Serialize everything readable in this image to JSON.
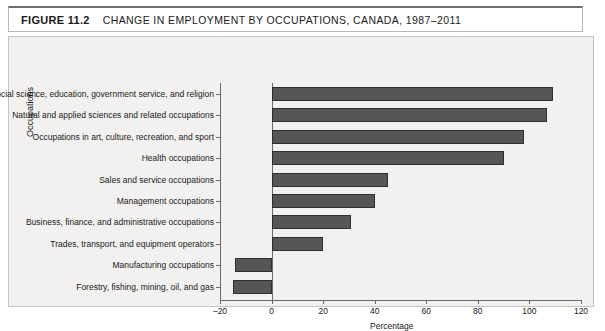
{
  "figure": {
    "label": "FIGURE 11.2",
    "title": "CHANGE IN EMPLOYMENT BY OCCUPATIONS, CANADA, 1987–2011"
  },
  "colors": {
    "bar_fill": "#565656",
    "bar_border": "#2f2f2f",
    "plot_background": "#f2f1ef",
    "frame_border": "#c4c3c1",
    "axis": "#6b6b6b",
    "text": "#1a1a1a"
  },
  "chart_data": {
    "type": "bar",
    "orientation": "horizontal",
    "title": "CHANGE IN EMPLOYMENT BY OCCUPATIONS, CANADA, 1987–2011",
    "xlabel": "Percentage",
    "ylabel": "Occupations",
    "xlim": [
      -20,
      120
    ],
    "xticks": [
      -20,
      0,
      20,
      40,
      60,
      80,
      100,
      120
    ],
    "xtick_labels": [
      "–20",
      "0",
      "20",
      "40",
      "60",
      "80",
      "100",
      "120"
    ],
    "grid": false,
    "legend": null,
    "categories": [
      "Social science, education, government service, and religion",
      "Natural and applied sciences and related occupations",
      "Occupations in art, culture, recreation, and sport",
      "Health occupations",
      "Sales and service occupations",
      "Management occupations",
      "Business, finance, and administrative occupations",
      "Trades, transport, and equipment operators",
      "Manufacturing occupations",
      "Forestry, fishing, mining, oil, and gas"
    ],
    "values": [
      109,
      107,
      98,
      90,
      45,
      40,
      31,
      20,
      -14,
      -15
    ]
  }
}
